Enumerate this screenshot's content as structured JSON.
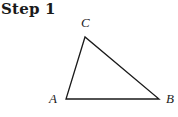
{
  "header": {
    "title": "Step 1"
  },
  "diagram": {
    "type": "triangle",
    "vertices": [
      {
        "label": "A",
        "x": 66,
        "y": 99
      },
      {
        "label": "B",
        "x": 159,
        "y": 99
      },
      {
        "label": "C",
        "x": 85,
        "y": 37
      }
    ],
    "labels": {
      "A": "A",
      "B": "B",
      "C": "C"
    },
    "stroke_color": "#1a1a1a"
  }
}
